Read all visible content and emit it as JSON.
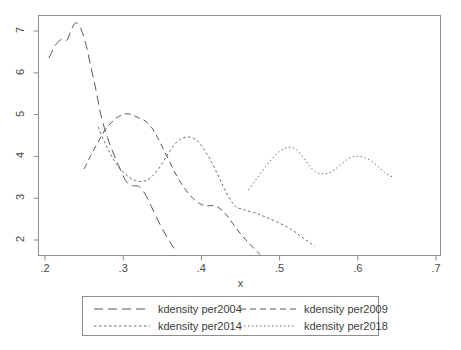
{
  "chart_data": {
    "type": "line",
    "title": "",
    "subtitle": "",
    "xlabel": "x",
    "ylabel": "",
    "xlim": [
      0.2,
      0.7
    ],
    "ylim": [
      1.55,
      7.4
    ],
    "grid": false,
    "legend_position": "bottom",
    "xticks": [
      ".2",
      ".3",
      ".4",
      ".5",
      ".6",
      ".7"
    ],
    "xtick_values": [
      0.2,
      0.3,
      0.4,
      0.5,
      0.6,
      0.7
    ],
    "yticks": [
      "2",
      "3",
      "4",
      "5",
      "6",
      "7"
    ],
    "ytick_values": [
      2,
      3,
      4,
      5,
      6,
      7
    ],
    "series": [
      {
        "name": "kdensity per2004",
        "dash": "long-dash",
        "dash_pattern": "9,5",
        "color": "#555555",
        "x": [
          0.205,
          0.213,
          0.221,
          0.228,
          0.234,
          0.24,
          0.246,
          0.252,
          0.258,
          0.265,
          0.272,
          0.28,
          0.288,
          0.296,
          0.304,
          0.312,
          0.32,
          0.328,
          0.336,
          0.345,
          0.355,
          0.365
        ],
        "y": [
          6.35,
          6.65,
          6.8,
          6.78,
          7.05,
          7.2,
          7.05,
          6.7,
          6.2,
          5.6,
          4.95,
          4.45,
          4.05,
          3.7,
          3.4,
          3.3,
          3.28,
          3.1,
          2.8,
          2.45,
          2.1,
          1.8
        ]
      },
      {
        "name": "kdensity per2009",
        "dash": "medium-dash",
        "dash_pattern": "6,4",
        "color": "#555555",
        "x": [
          0.25,
          0.258,
          0.266,
          0.274,
          0.282,
          0.29,
          0.298,
          0.305,
          0.312,
          0.32,
          0.328,
          0.336,
          0.344,
          0.352,
          0.36,
          0.368,
          0.376,
          0.384,
          0.392,
          0.4,
          0.408,
          0.416,
          0.424,
          0.432,
          0.44,
          0.45,
          0.462,
          0.475
        ],
        "y": [
          3.7,
          4.0,
          4.28,
          4.55,
          4.75,
          4.9,
          4.99,
          5.02,
          4.99,
          4.92,
          4.85,
          4.7,
          4.45,
          4.15,
          3.85,
          3.55,
          3.3,
          3.1,
          2.95,
          2.85,
          2.82,
          2.82,
          2.75,
          2.6,
          2.4,
          2.15,
          1.9,
          1.65
        ]
      },
      {
        "name": "kdensity per2014",
        "dash": "fine-dash",
        "dash_pattern": "2.5,2.5",
        "color": "#6b6b6b",
        "x": [
          0.268,
          0.276,
          0.284,
          0.292,
          0.3,
          0.308,
          0.316,
          0.324,
          0.332,
          0.34,
          0.348,
          0.356,
          0.364,
          0.372,
          0.38,
          0.388,
          0.396,
          0.404,
          0.412,
          0.42,
          0.428,
          0.436,
          0.444,
          0.455,
          0.468,
          0.482,
          0.498,
          0.515,
          0.53,
          0.545
        ],
        "y": [
          4.7,
          4.35,
          4.05,
          3.8,
          3.62,
          3.5,
          3.42,
          3.4,
          3.45,
          3.58,
          3.78,
          4.02,
          4.25,
          4.4,
          4.46,
          4.45,
          4.35,
          4.15,
          3.9,
          3.6,
          3.28,
          3.0,
          2.8,
          2.72,
          2.65,
          2.55,
          2.42,
          2.25,
          2.05,
          1.85
        ]
      },
      {
        "name": "kdensity per2018",
        "dash": "dotted",
        "dash_pattern": "1.5,2.5",
        "color": "#6b6b6b",
        "x": [
          0.46,
          0.468,
          0.476,
          0.484,
          0.492,
          0.5,
          0.508,
          0.515,
          0.522,
          0.53,
          0.538,
          0.546,
          0.554,
          0.562,
          0.57,
          0.578,
          0.586,
          0.594,
          0.602,
          0.61,
          0.618,
          0.626,
          0.634,
          0.645
        ],
        "y": [
          3.2,
          3.4,
          3.6,
          3.8,
          3.98,
          4.12,
          4.2,
          4.22,
          4.15,
          3.98,
          3.78,
          3.63,
          3.58,
          3.6,
          3.68,
          3.8,
          3.92,
          3.99,
          4.0,
          3.96,
          3.88,
          3.76,
          3.62,
          3.5
        ]
      }
    ]
  },
  "axis": {
    "xlabel": "x"
  },
  "legend": {
    "entries": [
      {
        "label": "kdensity per2004"
      },
      {
        "label": "kdensity per2009"
      },
      {
        "label": "kdensity per2014"
      },
      {
        "label": "kdensity per2018"
      }
    ]
  }
}
